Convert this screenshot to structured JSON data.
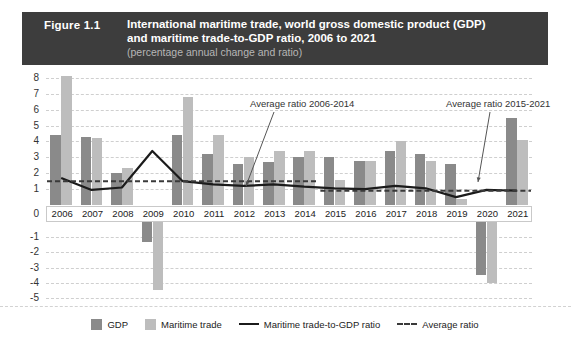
{
  "header": {
    "figure_label": "Figure 1.1",
    "title_line1": "International maritime trade, world gross domestic product (GDP)",
    "title_line2": "and maritime trade-to-GDP ratio, 2006 to 2021",
    "subtitle": "(percentage annual change and ratio)",
    "band_color": "#3d3d3d"
  },
  "legend": {
    "items": [
      {
        "label": "GDP",
        "type": "swatch",
        "color": "#8a8a8a"
      },
      {
        "label": "Maritime trade",
        "type": "swatch",
        "color": "#bdbdbd"
      },
      {
        "label": "Maritime trade-to-GDP ratio",
        "type": "line",
        "color": "#1b1b1b"
      },
      {
        "label": "Average ratio",
        "type": "dashed",
        "color": "#3a3a3a"
      }
    ]
  },
  "annotations": [
    {
      "text": "Average ratio 2006-2014"
    },
    {
      "text": "Average ratio 2015-2021"
    }
  ],
  "axis": {
    "positive_ticks": [
      "8",
      "7",
      "6",
      "5",
      "4",
      "3",
      "2",
      "1"
    ],
    "zero_tick": "0",
    "negative_ticks": [
      "-1",
      "-2",
      "-3",
      "-4",
      "-5"
    ]
  },
  "chart_data": {
    "type": "bar",
    "title": "International maritime trade, world gross domestic product (GDP) and maritime trade-to-GDP ratio, 2006 to 2021",
    "subtitle": "(percentage annual change and ratio)",
    "xlabel": "",
    "ylabel": "",
    "ylim": [
      -5,
      8
    ],
    "grid": true,
    "legend_position": "bottom",
    "categories": [
      "2006",
      "2007",
      "2008",
      "2009",
      "2010",
      "2011",
      "2012",
      "2013",
      "2014",
      "2015",
      "2016",
      "2017",
      "2018",
      "2019",
      "2020",
      "2021"
    ],
    "series": [
      {
        "name": "GDP",
        "type": "bar",
        "color": "#8a8a8a",
        "values": [
          4.4,
          4.3,
          2.0,
          -1.3,
          4.4,
          3.2,
          2.6,
          2.7,
          3.0,
          3.0,
          2.8,
          3.4,
          3.2,
          2.6,
          -3.5,
          5.5
        ]
      },
      {
        "name": "Maritime trade",
        "type": "bar",
        "color": "#bdbdbd",
        "values": [
          8.1,
          4.2,
          2.3,
          -4.5,
          6.8,
          4.4,
          3.0,
          3.4,
          3.4,
          1.6,
          2.8,
          4.0,
          2.8,
          0.4,
          -4.0,
          4.1
        ]
      },
      {
        "name": "Maritime trade-to-GDP ratio",
        "type": "line",
        "color": "#1b1b1b",
        "values": [
          1.7,
          0.95,
          1.1,
          3.4,
          1.5,
          1.3,
          1.2,
          1.3,
          1.15,
          1.05,
          1.0,
          1.2,
          1.05,
          0.5,
          0.95,
          0.9
        ]
      },
      {
        "name": "Average ratio",
        "type": "dashed-segments",
        "color": "#3a3a3a",
        "segments": [
          {
            "label": "Average ratio 2006-2014",
            "from": "2006",
            "to": "2014",
            "value": 1.5
          },
          {
            "label": "Average ratio 2015-2021",
            "from": "2015",
            "to": "2021",
            "value": 0.9
          }
        ]
      }
    ]
  }
}
